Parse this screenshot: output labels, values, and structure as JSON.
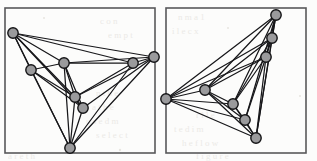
{
  "figure": {
    "background_color": "#fbfbfa",
    "frame_color": "#58585a",
    "edge_color": "#17171a",
    "node_fill": "#9a9a9c",
    "node_stroke": "#141416",
    "node_radius": 5.2,
    "panel_count": 2
  },
  "chart_data": {
    "type": "scatter",
    "xlabel": "",
    "ylabel": "",
    "panels": [
      {
        "name": "left-drawing",
        "frame": {
          "x": 5,
          "y": 8,
          "width": 150,
          "height": 145
        },
        "node_count": 8,
        "edge_count": 23,
        "nodes": [
          {
            "id": "a",
            "x": 13,
            "y": 33
          },
          {
            "id": "b",
            "x": 31,
            "y": 70
          },
          {
            "id": "c",
            "x": 64,
            "y": 63
          },
          {
            "id": "d",
            "x": 75,
            "y": 97
          },
          {
            "id": "e",
            "x": 83,
            "y": 108
          },
          {
            "id": "f",
            "x": 133,
            "y": 63
          },
          {
            "id": "g",
            "x": 154,
            "y": 57
          },
          {
            "id": "h",
            "x": 70,
            "y": 148
          }
        ],
        "edges": [
          [
            "a",
            "b"
          ],
          [
            "a",
            "c"
          ],
          [
            "a",
            "d"
          ],
          [
            "a",
            "e"
          ],
          [
            "a",
            "f"
          ],
          [
            "a",
            "g"
          ],
          [
            "a",
            "h"
          ],
          [
            "b",
            "c"
          ],
          [
            "b",
            "d"
          ],
          [
            "b",
            "e"
          ],
          [
            "b",
            "h"
          ],
          [
            "c",
            "d"
          ],
          [
            "c",
            "e"
          ],
          [
            "c",
            "f"
          ],
          [
            "c",
            "g"
          ],
          [
            "c",
            "h"
          ],
          [
            "d",
            "e"
          ],
          [
            "d",
            "f"
          ],
          [
            "d",
            "g"
          ],
          [
            "d",
            "h"
          ],
          [
            "e",
            "g"
          ],
          [
            "e",
            "h"
          ],
          [
            "f",
            "g"
          ],
          [
            "f",
            "h"
          ],
          [
            "g",
            "h"
          ]
        ]
      },
      {
        "name": "right-drawing",
        "frame": {
          "x": 166,
          "y": 8,
          "width": 140,
          "height": 145
        },
        "node_count": 8,
        "edge_count": 23,
        "nodes": [
          {
            "id": "a",
            "x": 276,
            "y": 15
          },
          {
            "id": "b",
            "x": 272,
            "y": 38
          },
          {
            "id": "c",
            "x": 266,
            "y": 57
          },
          {
            "id": "d",
            "x": 205,
            "y": 90
          },
          {
            "id": "e",
            "x": 166,
            "y": 99
          },
          {
            "id": "f",
            "x": 233,
            "y": 104
          },
          {
            "id": "g",
            "x": 245,
            "y": 120
          },
          {
            "id": "h",
            "x": 256,
            "y": 138
          }
        ],
        "edges": [
          [
            "a",
            "b"
          ],
          [
            "a",
            "c"
          ],
          [
            "a",
            "d"
          ],
          [
            "a",
            "e"
          ],
          [
            "a",
            "f"
          ],
          [
            "a",
            "g"
          ],
          [
            "a",
            "h"
          ],
          [
            "b",
            "c"
          ],
          [
            "b",
            "d"
          ],
          [
            "b",
            "e"
          ],
          [
            "b",
            "f"
          ],
          [
            "b",
            "h"
          ],
          [
            "c",
            "d"
          ],
          [
            "c",
            "e"
          ],
          [
            "c",
            "f"
          ],
          [
            "c",
            "g"
          ],
          [
            "c",
            "h"
          ],
          [
            "d",
            "e"
          ],
          [
            "d",
            "f"
          ],
          [
            "d",
            "g"
          ],
          [
            "d",
            "h"
          ],
          [
            "e",
            "f"
          ],
          [
            "e",
            "g"
          ],
          [
            "e",
            "h"
          ],
          [
            "f",
            "g"
          ],
          [
            "f",
            "h"
          ],
          [
            "g",
            "h"
          ]
        ]
      }
    ]
  }
}
